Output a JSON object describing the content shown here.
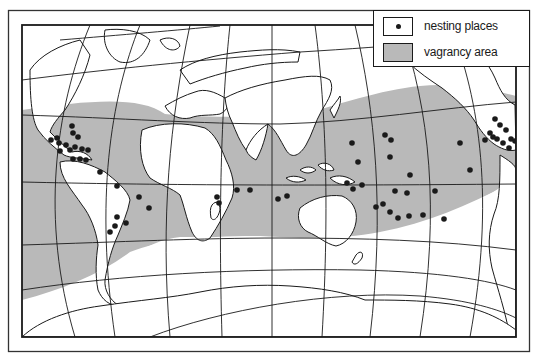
{
  "legend": {
    "items": [
      {
        "label": "nesting places",
        "symbol": "filled-dot"
      },
      {
        "label": "vagrancy area",
        "symbol": "gray-fill"
      }
    ]
  },
  "colors": {
    "ink": "#1a1a1a",
    "vagrancy_fill": "#b9b9b9",
    "land": "#ffffff",
    "ocean": "#ffffff"
  },
  "map": {
    "projection": "world map, curved graticule",
    "frame": {
      "outer": [
        8,
        10,
        530,
        352
      ],
      "inner": [
        22,
        25,
        516,
        337
      ]
    },
    "nesting_places": [
      [
        72,
        126
      ],
      [
        73,
        133
      ],
      [
        78,
        137
      ],
      [
        51,
        140
      ],
      [
        57,
        138
      ],
      [
        59,
        143
      ],
      [
        75,
        147
      ],
      [
        70,
        150
      ],
      [
        66,
        145
      ],
      [
        82,
        149
      ],
      [
        88,
        150
      ],
      [
        60,
        151
      ],
      [
        73,
        159
      ],
      [
        80,
        159
      ],
      [
        86,
        160
      ],
      [
        100,
        172
      ],
      [
        117,
        186
      ],
      [
        139,
        197
      ],
      [
        149,
        208
      ],
      [
        117,
        217
      ],
      [
        115,
        226
      ],
      [
        110,
        232
      ],
      [
        126,
        223
      ],
      [
        217,
        197
      ],
      [
        237,
        190
      ],
      [
        250,
        190
      ],
      [
        219,
        203
      ],
      [
        278,
        199
      ],
      [
        287,
        196
      ],
      [
        347,
        183
      ],
      [
        353,
        189
      ],
      [
        352,
        143
      ],
      [
        358,
        162
      ],
      [
        385,
        135
      ],
      [
        391,
        140
      ],
      [
        390,
        157
      ],
      [
        410,
        175
      ],
      [
        362,
        185
      ],
      [
        395,
        191
      ],
      [
        407,
        193
      ],
      [
        376,
        207
      ],
      [
        383,
        204
      ],
      [
        390,
        212
      ],
      [
        398,
        218
      ],
      [
        409,
        216
      ],
      [
        423,
        215
      ],
      [
        444,
        219
      ],
      [
        435,
        191
      ],
      [
        460,
        143
      ],
      [
        470,
        170
      ],
      [
        495,
        119
      ],
      [
        500,
        125
      ],
      [
        506,
        130
      ],
      [
        490,
        133
      ],
      [
        493,
        137
      ],
      [
        485,
        140
      ],
      [
        497,
        139
      ],
      [
        503,
        143
      ],
      [
        511,
        139
      ],
      [
        509,
        148
      ],
      [
        515,
        141
      ]
    ]
  }
}
